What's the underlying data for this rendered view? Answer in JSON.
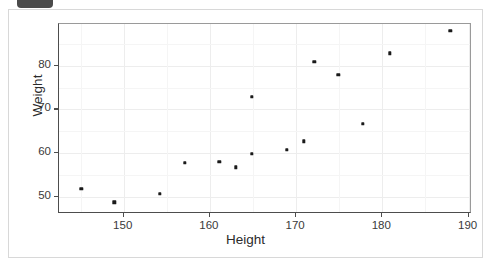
{
  "badge": {
    "name": "cut-off-toolbar-badge",
    "color": "#4a4a4a"
  },
  "card": {
    "background": "#ffffff",
    "border_color": "#d8d8d8"
  },
  "chart_data": {
    "type": "scatter",
    "title": "",
    "xlabel": "Height",
    "ylabel": "Weight",
    "xlim": [
      142.5,
      190.4
    ],
    "ylim": [
      46.0,
      89.6
    ],
    "xticks": [
      150,
      160,
      170,
      180,
      190
    ],
    "yticks": [
      50,
      60,
      70,
      80
    ],
    "xtick_labels": [
      "150",
      "160",
      "170",
      "180",
      "190"
    ],
    "ytick_labels": [
      "50",
      "60",
      "70",
      "80"
    ],
    "grid": true,
    "grid_color": "#ededed",
    "legend": null,
    "point_color": "#1a1a1a",
    "point_size": 3.4,
    "series": [
      {
        "name": "observations",
        "x": [
          145.1,
          148.9,
          154.2,
          157.1,
          161.1,
          163.0,
          164.9,
          164.9,
          168.9,
          170.9,
          172.1,
          174.9,
          177.7,
          180.9,
          187.9
        ],
        "y": [
          51.8,
          48.7,
          50.7,
          57.8,
          58.0,
          56.7,
          59.8,
          72.9,
          60.7,
          62.7,
          80.9,
          78.0,
          66.7,
          82.9,
          88.0
        ]
      }
    ]
  }
}
